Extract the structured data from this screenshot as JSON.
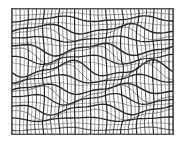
{
  "figure": {
    "title": "",
    "background_color": "#ffffff",
    "border_color": "#555555",
    "border_width": 1
  },
  "plot_area": {
    "x": 11,
    "y": 8,
    "width": 163,
    "height": 127
  },
  "chart_data": {
    "type": "line",
    "title": "",
    "subtitle": "",
    "xlabel": "",
    "ylabel": "",
    "xlim": [
      0,
      41
    ],
    "ylim": [
      0,
      25
    ],
    "grid": false,
    "legend": null,
    "annotations": [],
    "xtick_labels": [],
    "ytick_labels": [],
    "style": {
      "line_color": "#3a3a3a",
      "line_color_strong": "#1e1e1e",
      "line_width_min": 0.55,
      "line_width_max": 1.5
    },
    "mesh": {
      "n_vertical_lines": 42,
      "n_horizontal_lines": 26,
      "vertical_index_range": [
        0,
        41
      ],
      "horizontal_index_range": [
        0,
        25
      ],
      "vertical_distortion": {
        "description": "Vertical lines are nearly straight, perturbed by a small-amplitude vertical-varying sine in x.",
        "amplitude_px": [
          0.2,
          2.2
        ],
        "wavelength_rows": 9.0,
        "phase_step_per_column": 0.22
      },
      "horizontal_distortion": {
        "description": "Horizontal lines carry strong sinusoidal displacement in y; amplitude and phase vary per row producing crossing / bunching bands.",
        "amplitude_px": [
          0.5,
          8.5
        ],
        "wavelength_columns": 21.0,
        "phase_step_per_row": 0.55
      },
      "row_amplitudes": [
        1.2,
        3.4,
        5.1,
        2.0,
        6.3,
        7.4,
        3.0,
        1.5,
        5.8,
        8.2,
        4.1,
        2.3,
        6.9,
        7.8,
        3.6,
        1.1,
        4.7,
        8.5,
        5.4,
        2.7,
        6.1,
        7.0,
        3.2,
        1.8,
        4.4,
        0.9
      ],
      "row_phases": [
        0.0,
        0.55,
        1.1,
        1.65,
        2.2,
        2.75,
        3.3,
        3.85,
        4.4,
        4.95,
        5.5,
        6.05,
        0.32,
        0.87,
        1.42,
        1.97,
        2.52,
        3.07,
        3.62,
        4.17,
        4.72,
        5.27,
        5.82,
        0.09,
        0.64,
        1.19
      ],
      "row_weights": [
        1.2,
        0.75,
        1.4,
        0.7,
        1.45,
        0.8,
        1.3,
        0.7,
        1.5,
        0.85,
        1.25,
        0.7,
        1.4,
        0.8,
        1.35,
        0.7,
        1.45,
        0.9,
        1.3,
        0.7,
        1.4,
        0.8,
        1.35,
        0.7,
        1.2,
        1.1
      ],
      "col_weights": [
        1.3,
        0.7,
        1.15,
        0.7,
        1.2,
        0.7,
        1.1,
        0.75,
        1.25,
        0.7,
        1.1,
        0.7,
        1.2,
        0.75,
        1.15,
        0.7,
        1.25,
        0.7,
        1.1,
        0.75,
        1.2,
        0.7,
        1.15,
        0.7,
        1.25,
        0.75,
        1.1,
        0.7,
        1.2,
        0.7,
        1.15,
        0.75,
        1.25,
        0.7,
        1.1,
        0.7,
        1.2,
        0.75,
        1.15,
        0.7,
        1.2,
        1.3
      ]
    }
  }
}
